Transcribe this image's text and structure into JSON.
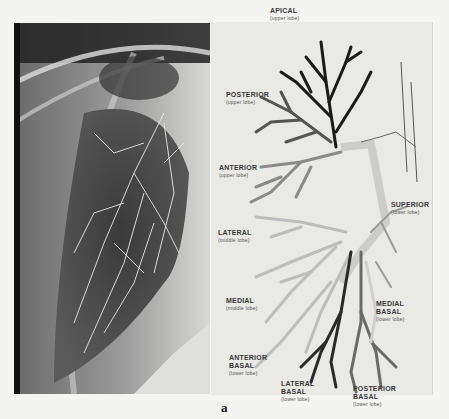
{
  "figure": {
    "caption": "a",
    "left_panel": "chest x-ray bronchogram (right lung)",
    "right_panel": "bronchial tree segment diagram"
  },
  "labels": [
    {
      "id": "apical",
      "title": "APICAL",
      "sub": "(upper lobe)",
      "x": 270,
      "y": 7
    },
    {
      "id": "posterior",
      "title": "POSTERIOR",
      "sub": "(upper lobe)",
      "x": 226,
      "y": 91
    },
    {
      "id": "anterior",
      "title": "ANTERIOR",
      "sub": "(upper lobe)",
      "x": 219,
      "y": 164
    },
    {
      "id": "superior",
      "title": "SUPERIOR",
      "sub": "(lower lobe)",
      "x": 391,
      "y": 201
    },
    {
      "id": "lateral",
      "title": "LATERAL",
      "sub": "(middle lobe)",
      "x": 218,
      "y": 229
    },
    {
      "id": "medial",
      "title": "MEDIAL",
      "sub": "(middle lobe)",
      "x": 226,
      "y": 297
    },
    {
      "id": "medial-basal",
      "title": "MEDIAL\nBASAL",
      "sub": "(lower lobe)",
      "x": 376,
      "y": 292
    },
    {
      "id": "anterior-basal",
      "title": "ANTERIOR\nBASAL",
      "sub": "(lower lobe)",
      "x": 229,
      "y": 346
    },
    {
      "id": "lateral-basal",
      "title": "LATERAL\nBASAL",
      "sub": "(lower lobe)",
      "x": 281,
      "y": 372
    },
    {
      "id": "posterior-basal",
      "title": "POSTERIOR\nBASAL",
      "sub": "(lower lobe)",
      "x": 353,
      "y": 377
    }
  ],
  "colors": {
    "apical": "#1a1a1a",
    "posterior": "#555555",
    "anterior": "#888888",
    "lateral": "#b8b8b8",
    "basal_dark": "#2a2a2a",
    "basal_mid": "#6a6a6a",
    "trachea": "#f2f2f0"
  }
}
